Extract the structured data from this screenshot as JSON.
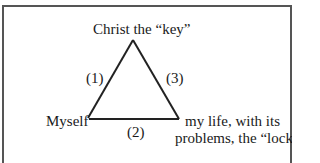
{
  "diagram": {
    "type": "triangle",
    "nodes": {
      "top": "Christ the “key”",
      "left": "Myself",
      "right_line1": "my life, with its",
      "right_line2": "problems, the “lock”"
    },
    "edges": {
      "left": "(1)",
      "bottom": "(2)",
      "right": "(3)"
    }
  }
}
